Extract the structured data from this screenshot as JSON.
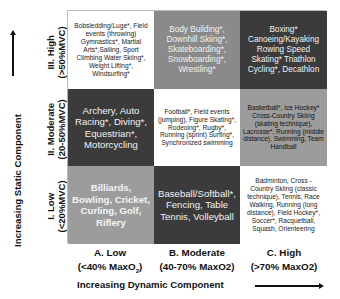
{
  "y_axis": {
    "title": "Increasing Static Component",
    "rows": [
      {
        "label": "III. High",
        "range": "(>50%MVC)"
      },
      {
        "label": "II. Moderate",
        "range": "(20-50%MVC)"
      },
      {
        "label": "I. Low",
        "range": "(<20%MVC)"
      }
    ]
  },
  "x_axis": {
    "title": "Increasing Dynamic Component",
    "columns": [
      {
        "label": "A. Low",
        "range": "(<40% MaxO",
        "range_sub": "2",
        "range_end": ")"
      },
      {
        "label": "B. Moderate",
        "range": "(40-70% MaxO2)"
      },
      {
        "label": "C. High",
        "range": "(>70% MaxO2)"
      }
    ]
  },
  "cells": {
    "IIIA": "Bobsledding/Luge*, Field events (throwing) Gymnastics*, Martial Arts*,Sailing, Sport Climbing Water Skiing*, Weight Lifting*, Windsurfing*",
    "IIIB": "Body Building*, Downhill Skiing*, Skateboarding*, Snowboarding*, Wrestling*",
    "IIIC": "Boxing* Canoeing/Kayaking Rowing Speed Skating* Triathlon Cycling*, Decathlon",
    "IIA": "Archery, Auto Racing*, Diving*, Equestrian*, Motorcycling",
    "IIB": "Football*, Field events (jumping), Figure Skating*, Rodeoing*, Rugby*, Running (sprint) Surfing*, Synchronized swimming",
    "IIC": "Basketball*, Ice Hockey* Cross-Country Skiing (skating technique), Lacrosse*, Running (middle distance), Swimming, Team Handball",
    "IA": "Billiards, Bowling, Cricket, Curling, Golf, Riflery",
    "IB": "Baseball/Softball*, Fencing, Table Tennis, Volleyball",
    "IC": "Badminton, Cross - Country Skiing (classic technique), Tennis, Race Walking, Running (long distance), Field Hockey*, Soccer*, Racquetball, Squash, Orienteering"
  },
  "colors": {
    "white": "#ffffff",
    "mid_gray": "#8a8a8a",
    "dark_gray": "#3b3b3b",
    "light_gray": "#9c9c9c"
  }
}
